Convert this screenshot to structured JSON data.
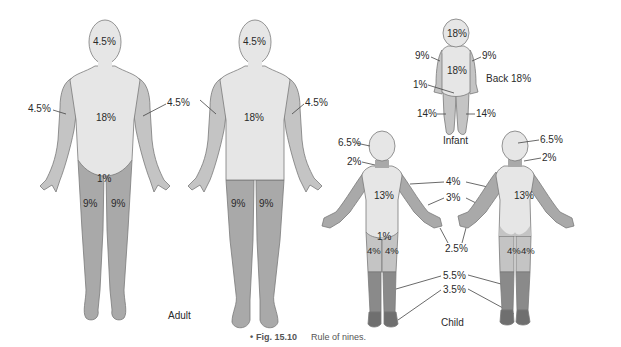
{
  "figure": {
    "number": "Fig. 15.10",
    "caption": "Rule of nines.",
    "bullet": "•"
  },
  "colors": {
    "light": "#e6e6e6",
    "medium": "#c4c4c4",
    "mid_dark": "#a9a9a9",
    "dark": "#8a8a8a",
    "darker": "#6f6f6f",
    "outline": "#7a7a7a"
  },
  "adult": {
    "group_label": "Adult",
    "front": {
      "head": "4.5%",
      "left_arm": "4.5%",
      "right_arm": "4.5%",
      "trunk": "18%",
      "genitalia": "1%",
      "left_leg": "9%",
      "right_leg": "9%"
    },
    "back": {
      "head": "4.5%",
      "right_arm": "4.5%",
      "trunk": "18%",
      "left_leg": "9%",
      "right_leg": "9%"
    }
  },
  "infant": {
    "group_label": "Infant",
    "head": "18%",
    "left_arm": "9%",
    "right_arm": "9%",
    "trunk": "18%",
    "genitalia": "1%",
    "left_leg": "14%",
    "right_leg": "14%",
    "back_note": "Back 18%"
  },
  "child": {
    "group_label": "Child",
    "head": "6.5%",
    "neck": "2%",
    "upper_arm": "4%",
    "forearm": "3%",
    "hand": "2.5%",
    "trunk_front": "13%",
    "trunk_back": "13%",
    "genitalia": "1%",
    "thigh_left": "4%",
    "thigh_right": "4%",
    "back_thigh_left": "4%",
    "back_thigh_right": "4%",
    "lower_leg": "5.5%",
    "foot": "3.5%",
    "back_head": "6.5%",
    "back_neck": "2%"
  }
}
